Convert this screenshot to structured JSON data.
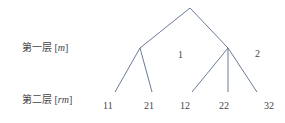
{
  "levels": [
    {
      "prefix": "第一层 [",
      "var": "m",
      "suffix": "]"
    },
    {
      "prefix": "第二层 [",
      "var": "rm",
      "suffix": "]"
    }
  ],
  "branch_labels": [
    "1",
    "2"
  ],
  "leaves": [
    "11",
    "21",
    "12",
    "22",
    "32"
  ],
  "colors": {
    "line": "#6b7a99",
    "text": "#444444"
  },
  "tree": {
    "root": [
      190,
      8
    ],
    "internal": [
      [
        140,
        48
      ],
      [
        228,
        48
      ]
    ],
    "leaf_points": [
      [
        115,
        92
      ],
      [
        152,
        92
      ],
      [
        192,
        92
      ],
      [
        228,
        92
      ],
      [
        257,
        92
      ]
    ]
  }
}
